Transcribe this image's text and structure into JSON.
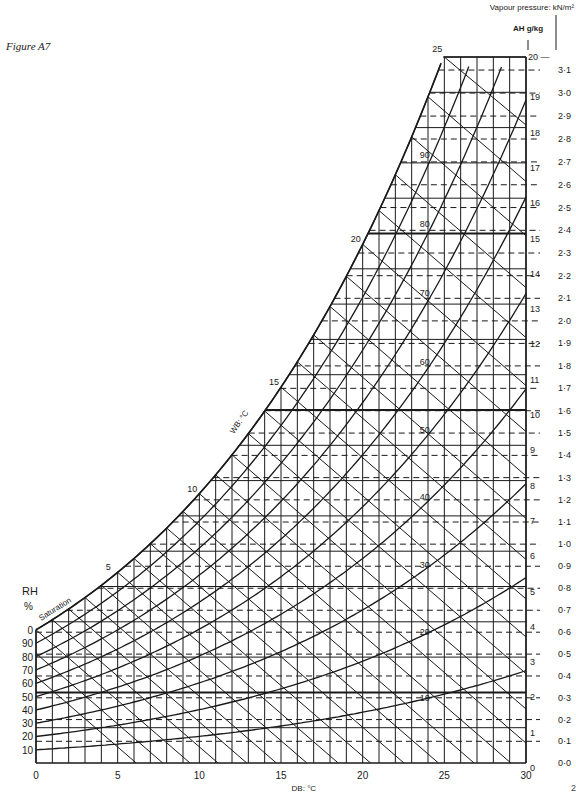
{
  "figure_label": "Figure A7",
  "page_number_fragment": "2",
  "chart_data": {
    "type": "line",
    "subtype": "psychrometric chart",
    "title": "",
    "xlabel": "DB: °C",
    "ylabel_left": "RH %",
    "ylabel_right_inner": "AH g/kg",
    "ylabel_right_outer": "Vapour pressure: kN/m²",
    "curve_label_saturation": "Saturation",
    "curve_label_wb": "WB: °C",
    "xlim": [
      0,
      30
    ],
    "x_ticks": [
      0,
      5,
      10,
      15,
      20,
      25,
      30
    ],
    "ah_lim": [
      0,
      20
    ],
    "ah_ticks": [
      0,
      1,
      2,
      3,
      4,
      5,
      6,
      7,
      8,
      9,
      10,
      11,
      12,
      13,
      14,
      15,
      16,
      17,
      18,
      19,
      20
    ],
    "vp_ticks": [
      "0·0",
      "0·1",
      "0·2",
      "0·3",
      "0·4",
      "0·5",
      "0·6",
      "0·7",
      "0·8",
      "0·9",
      "1·0",
      "1·1",
      "1·2",
      "1·3",
      "1·4",
      "1·5",
      "1·6",
      "1·7",
      "1·8",
      "1·9",
      "2·0",
      "2·1",
      "2·2",
      "2·3",
      "2·4",
      "2·5",
      "2·6",
      "2·7",
      "2·8",
      "2·9",
      "3·0",
      "3·1",
      "3·2"
    ],
    "rh_curves": [
      10,
      20,
      30,
      40,
      50,
      60,
      70,
      80,
      90,
      100
    ],
    "rh_left_labels": [
      "10",
      "20",
      "30",
      "40",
      "50",
      "60",
      "70",
      "80",
      "90",
      "0"
    ],
    "rh_inline_labels": [
      {
        "label": "10",
        "db": 28
      },
      {
        "label": "20",
        "db": 28
      },
      {
        "label": "30",
        "db": 28
      },
      {
        "label": "40",
        "db": 28
      },
      {
        "label": "50",
        "db": 28
      },
      {
        "label": "60",
        "db": 28
      },
      {
        "label": "70",
        "db": 28
      },
      {
        "label": "80",
        "db": 28
      },
      {
        "label": "90",
        "db": 28
      }
    ],
    "wb_labels": [
      0,
      5,
      10,
      15,
      20,
      25
    ],
    "saturation_ah_gkg": [
      {
        "db": 0,
        "ah": 3.8
      },
      {
        "db": 5,
        "ah": 5.4
      },
      {
        "db": 10,
        "ah": 7.6
      },
      {
        "db": 15,
        "ah": 10.7
      },
      {
        "db": 20,
        "ah": 14.7
      },
      {
        "db": 25,
        "ah": 20.0
      }
    ],
    "grid": {
      "vertical_every_degC": 1,
      "ah_solid_every_gkg": 1,
      "vp_dashed_every_kNm2": 0.1,
      "heavy_ah_lines": [
        2,
        10,
        15
      ]
    },
    "colors": {
      "ink": "#1a1a1a",
      "paper": "#ffffff"
    }
  }
}
